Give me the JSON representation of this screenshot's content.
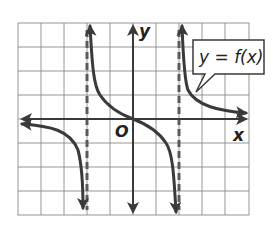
{
  "figure": {
    "type": "function-graph",
    "function_label": "y = f(x)",
    "function_label_parts": {
      "lhs": "y",
      "eq": " = ",
      "rhs": "f(x)"
    },
    "x_axis_label": "x",
    "y_axis_label": "y",
    "origin_label": "O",
    "grid": {
      "columns": 10,
      "rows": 8,
      "x_range": [
        -5,
        5
      ],
      "y_range": [
        -4,
        4
      ]
    },
    "vertical_asymptotes": [
      -2,
      2
    ],
    "curve_description": "decreasing tangent-like branches passing through the origin, odd symmetric",
    "colors": {
      "grid": "#8a8a8a",
      "curve": "#3a3a3a",
      "asymptote": "#5a5a5a",
      "background": "#ffffff"
    }
  }
}
